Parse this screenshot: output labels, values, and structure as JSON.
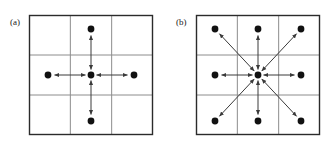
{
  "figure": {
    "background_color": "#ffffff",
    "ink_color": "#111111",
    "grid_line_color": "#8c8c8c",
    "frame_color": "#2b2b2b",
    "dot_color": "#111111",
    "arrow_color": "#3a3a3a",
    "panels": [
      {
        "id": "panel-a",
        "label": "(a)",
        "label_x": 10,
        "label_y": 25,
        "connectivity": 4,
        "connectivity_name": "4-connectivity",
        "frame": {
          "x": 29,
          "y": 15,
          "width": 124,
          "height": 120
        },
        "grid": {
          "rows": 3,
          "cols": 3
        },
        "cell_width": 41.3,
        "cell_height": 40,
        "center_dot": {
          "x": 91,
          "y": 75,
          "r": 3.4
        },
        "neighbor_dots": [
          {
            "name": "north",
            "x": 91,
            "y": 29,
            "r": 3.4
          },
          {
            "name": "south",
            "x": 91,
            "y": 121,
            "r": 3.4
          },
          {
            "name": "west",
            "x": 48,
            "y": 75,
            "r": 3.4
          },
          {
            "name": "east",
            "x": 134,
            "y": 75,
            "r": 3.4
          }
        ],
        "arrows": [
          {
            "name": "arrow-north",
            "x1": 91,
            "y1": 75,
            "x2": 91,
            "y2": 29
          },
          {
            "name": "arrow-south",
            "x1": 91,
            "y1": 75,
            "x2": 91,
            "y2": 121
          },
          {
            "name": "arrow-west",
            "x1": 91,
            "y1": 75,
            "x2": 48,
            "y2": 75
          },
          {
            "name": "arrow-east",
            "x1": 91,
            "y1": 75,
            "x2": 134,
            "y2": 75
          }
        ]
      },
      {
        "id": "panel-b",
        "label": "(b)",
        "label_x": 176,
        "label_y": 25,
        "connectivity": 8,
        "connectivity_name": "8-connectivity",
        "frame": {
          "x": 196,
          "y": 15,
          "width": 124,
          "height": 120
        },
        "grid": {
          "rows": 3,
          "cols": 3
        },
        "cell_width": 41.3,
        "cell_height": 40,
        "center_dot": {
          "x": 258,
          "y": 75,
          "r": 3.4
        },
        "neighbor_dots": [
          {
            "name": "north",
            "x": 258,
            "y": 29,
            "r": 3.4
          },
          {
            "name": "south",
            "x": 258,
            "y": 121,
            "r": 3.4
          },
          {
            "name": "west",
            "x": 215,
            "y": 75,
            "r": 3.4
          },
          {
            "name": "east",
            "x": 301,
            "y": 75,
            "r": 3.4
          },
          {
            "name": "northwest",
            "x": 215,
            "y": 29,
            "r": 3.4
          },
          {
            "name": "northeast",
            "x": 301,
            "y": 29,
            "r": 3.4
          },
          {
            "name": "southwest",
            "x": 215,
            "y": 121,
            "r": 3.4
          },
          {
            "name": "southeast",
            "x": 301,
            "y": 121,
            "r": 3.4
          }
        ],
        "arrows": [
          {
            "name": "arrow-north",
            "x1": 258,
            "y1": 75,
            "x2": 258,
            "y2": 29
          },
          {
            "name": "arrow-south",
            "x1": 258,
            "y1": 75,
            "x2": 258,
            "y2": 121
          },
          {
            "name": "arrow-west",
            "x1": 258,
            "y1": 75,
            "x2": 215,
            "y2": 75
          },
          {
            "name": "arrow-east",
            "x1": 258,
            "y1": 75,
            "x2": 301,
            "y2": 75
          },
          {
            "name": "arrow-northwest",
            "x1": 258,
            "y1": 75,
            "x2": 215,
            "y2": 29
          },
          {
            "name": "arrow-northeast",
            "x1": 258,
            "y1": 75,
            "x2": 301,
            "y2": 29
          },
          {
            "name": "arrow-southwest",
            "x1": 258,
            "y1": 75,
            "x2": 215,
            "y2": 121
          },
          {
            "name": "arrow-southeast",
            "x1": 258,
            "y1": 75,
            "x2": 301,
            "y2": 121
          }
        ]
      }
    ]
  }
}
